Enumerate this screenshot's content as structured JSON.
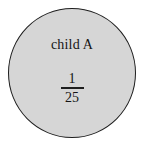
{
  "figure": {
    "type": "venn-single-set-diagram",
    "background_color": "#ffffff",
    "circle": {
      "fill_color": "#d6d6d6",
      "outline_color": "#1e1e1e",
      "label": "child A",
      "value": {
        "kind": "fraction",
        "numerator": "1",
        "denominator": "25",
        "display": "1/25"
      }
    }
  }
}
